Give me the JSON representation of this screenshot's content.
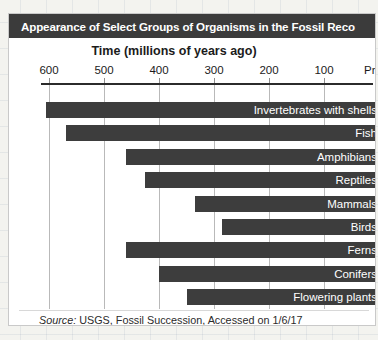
{
  "page": {
    "background_color": "#f3f3ef",
    "card_background": "#ffffff",
    "card_border_color": "#c9c9c9"
  },
  "header": {
    "title": "Appearance of Select Groups of Organisms in the Fossil Reco",
    "background_color": "#3b3b3b",
    "text_color": "#ffffff"
  },
  "footer": {
    "source_word": "Source:",
    "source_text": " USGS, Fossil Succession, Accessed on 1/6/17"
  },
  "chart_data": {
    "type": "bar",
    "orientation": "horizontal",
    "title": "Appearance of Select Groups of Organisms in the Fossil Reco",
    "xlabel": "Time (millions of years ago)",
    "ylabel": "",
    "xlim": [
      620,
      0
    ],
    "x_reversed": true,
    "grid": true,
    "legend": "none",
    "bar_color": "#3d3d3d",
    "axis_color": "#2b2b2b",
    "gridline_color": "#b9b9b9",
    "tick_labels": [
      "600",
      "500",
      "400",
      "300",
      "200",
      "100",
      "Prese"
    ],
    "tick_values": [
      600,
      500,
      400,
      300,
      200,
      100,
      0
    ],
    "value_unit": "millions of years ago",
    "categories": [
      "Invertebrates with shells",
      "Fish",
      "Amphibians",
      "Reptiles",
      "Mammals",
      "Birds",
      "Ferns",
      "Conifers",
      "Flowering plants"
    ],
    "values": [
      605,
      570,
      460,
      425,
      335,
      285,
      460,
      400,
      350
    ],
    "bars": [
      {
        "label": "Invertebrates with shells",
        "start": 605,
        "end": 0
      },
      {
        "label": "Fish",
        "start": 570,
        "end": 0
      },
      {
        "label": "Amphibians",
        "start": 460,
        "end": 0
      },
      {
        "label": "Reptiles",
        "start": 425,
        "end": 0
      },
      {
        "label": "Mammals",
        "start": 335,
        "end": 0
      },
      {
        "label": "Birds",
        "start": 285,
        "end": 0
      },
      {
        "label": "Ferns",
        "start": 460,
        "end": 0
      },
      {
        "label": "Conifers",
        "start": 400,
        "end": 0
      },
      {
        "label": "Flowering plants",
        "start": 350,
        "end": 0
      }
    ]
  }
}
